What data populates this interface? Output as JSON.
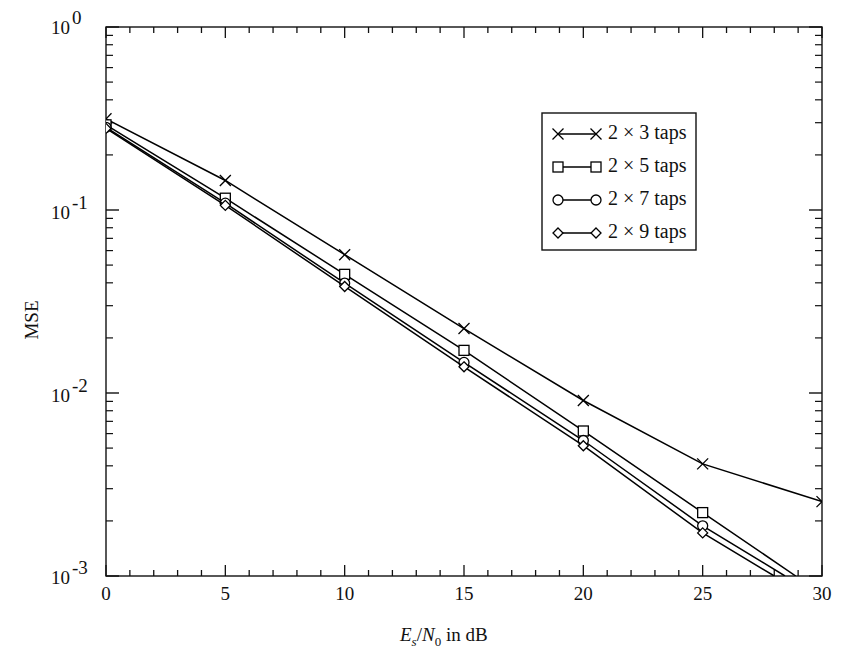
{
  "chart_data": {
    "type": "line",
    "title": "",
    "xlabel": "Es/N0 in dB",
    "ylabel": "MSE",
    "xlabel_parts": {
      "E": "E",
      "sub_s": "s",
      "slash": "/",
      "N": "N",
      "sub_0": "0",
      "tail": " in dB"
    },
    "xlim": [
      0,
      30
    ],
    "ylim": [
      0.001,
      1
    ],
    "yscale": "log",
    "grid": false,
    "legend_position": "upper right",
    "x_ticks": [
      0,
      5,
      10,
      15,
      20,
      25,
      30
    ],
    "x_tick_labels": [
      "0",
      "5",
      "10",
      "15",
      "20",
      "25",
      "30"
    ],
    "x_minor_step": 1,
    "y_ticks": [
      1,
      0.1,
      0.01,
      0.001
    ],
    "y_tick_labels": [
      "10",
      "10",
      "10",
      "10"
    ],
    "y_tick_exponents": [
      "0",
      "-1",
      "-2",
      "-3"
    ],
    "x": [
      0,
      5,
      10,
      15,
      20,
      25,
      30
    ],
    "series": [
      {
        "name": "2 × 3 taps",
        "marker": "x-marker",
        "color": "#000000",
        "x": [
          0,
          5,
          10,
          15,
          20,
          25,
          30
        ],
        "values": [
          0.315,
          0.145,
          0.057,
          0.0225,
          0.0091,
          0.0041,
          0.00255
        ]
      },
      {
        "name": "2 × 5 taps",
        "marker": "square-marker",
        "color": "#000000",
        "x": [
          0,
          5,
          10,
          15,
          20,
          25,
          28.9
        ],
        "values": [
          0.292,
          0.116,
          0.0445,
          0.0171,
          0.0062,
          0.00222,
          0.001
        ]
      },
      {
        "name": "2 × 7 taps",
        "marker": "circle-marker",
        "color": "#000000",
        "x": [
          0,
          5,
          10,
          15,
          20,
          25,
          28.45
        ],
        "values": [
          0.283,
          0.109,
          0.0398,
          0.0147,
          0.0055,
          0.00188,
          0.001
        ]
      },
      {
        "name": "2 × 9 taps",
        "marker": "diamond-marker",
        "color": "#000000",
        "x": [
          0,
          5,
          10,
          15,
          20,
          25,
          28.0
        ],
        "values": [
          0.279,
          0.106,
          0.0382,
          0.0139,
          0.00515,
          0.00172,
          0.001
        ]
      }
    ]
  },
  "legend": {
    "entries": [
      {
        "label": "2 × 3 taps",
        "marker": "x-marker"
      },
      {
        "label": "2 × 5 taps",
        "marker": "square-marker"
      },
      {
        "label": "2 × 7 taps",
        "marker": "circle-marker"
      },
      {
        "label": "2 × 9 taps",
        "marker": "diamond-marker"
      }
    ]
  },
  "axes": {
    "y_label": "MSE",
    "y_tick_0": {
      "mantissa": "10",
      "exp": "0"
    },
    "y_tick_1": {
      "mantissa": "10",
      "exp": "-1"
    },
    "y_tick_2": {
      "mantissa": "10",
      "exp": "-2"
    },
    "y_tick_3": {
      "mantissa": "10",
      "exp": "-3"
    },
    "x_tick_0": "0",
    "x_tick_1": "5",
    "x_tick_2": "10",
    "x_tick_3": "15",
    "x_tick_4": "20",
    "x_tick_5": "25",
    "x_tick_6": "30",
    "x_label_E": "E",
    "x_label_s": "s",
    "x_label_slash": "/",
    "x_label_N": "N",
    "x_label_0": "0",
    "x_label_tail": " in dB"
  },
  "colors": {
    "axis": "#111111",
    "line": "#000000",
    "background": "#ffffff"
  }
}
